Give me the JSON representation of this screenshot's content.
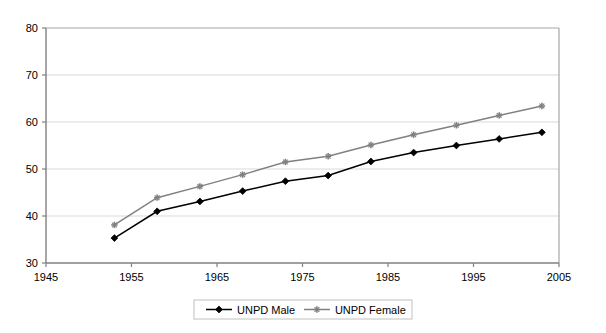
{
  "chart_data": {
    "type": "line",
    "title": "",
    "subtitle": "",
    "xlabel": "",
    "ylabel": "",
    "xlim": [
      1945,
      2005
    ],
    "ylim": [
      30,
      80
    ],
    "xticks": [
      1945,
      1955,
      1965,
      1975,
      1985,
      1995,
      2005
    ],
    "yticks": [
      30,
      40,
      50,
      60,
      70,
      80
    ],
    "xtick_labels": [
      "1945",
      "1955",
      "1965",
      "1975",
      "1985",
      "1995",
      "2005"
    ],
    "ytick_labels": [
      "30",
      "40",
      "50",
      "60",
      "70",
      "80"
    ],
    "grid": "horizontal",
    "legend_position": "bottom",
    "x": [
      1953,
      1958,
      1963,
      1968,
      1973,
      1978,
      1983,
      1988,
      1993,
      1998,
      2003
    ],
    "series": [
      {
        "name": "UNPD Male",
        "color": "#000000",
        "marker": "diamond",
        "values": [
          35.3,
          41.0,
          43.1,
          45.3,
          47.4,
          48.6,
          51.6,
          53.5,
          55.0,
          56.4,
          57.8
        ]
      },
      {
        "name": "UNPD Female",
        "color": "#808080",
        "marker": "star",
        "values": [
          38.1,
          43.9,
          46.3,
          48.8,
          51.5,
          52.7,
          55.1,
          57.3,
          59.3,
          61.4,
          63.4
        ]
      }
    ]
  },
  "legend": {
    "items": [
      {
        "label": "UNPD Male",
        "color": "#000000",
        "marker": "diamond"
      },
      {
        "label": "UNPD Female",
        "color": "#808080",
        "marker": "star"
      }
    ]
  },
  "colors": {
    "male": "#000000",
    "female": "#808080",
    "grid": "#d9d9d9",
    "axis": "#808080",
    "plot_background": "#ffffff",
    "legend_border": "#c0c0c0"
  }
}
